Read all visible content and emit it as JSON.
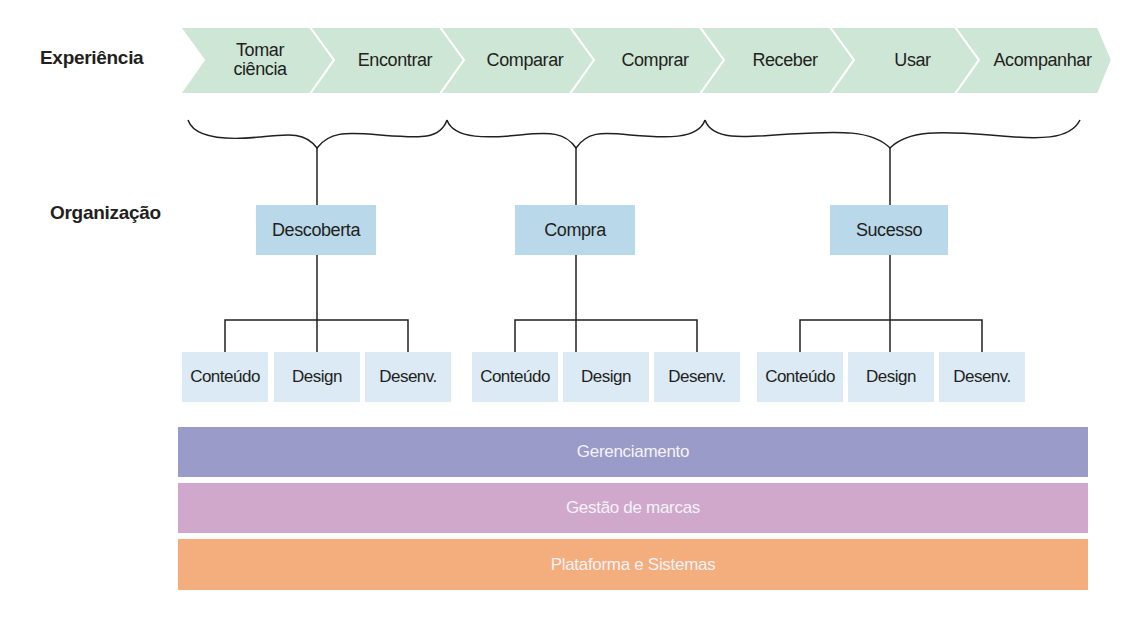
{
  "rows": {
    "experience_label": "Experiência",
    "organization_label": "Organização"
  },
  "experience_steps": [
    {
      "label": "Tomar\nciência"
    },
    {
      "label": "Encontrar"
    },
    {
      "label": "Comparar"
    },
    {
      "label": "Comprar"
    },
    {
      "label": "Receber"
    },
    {
      "label": "Usar"
    },
    {
      "label": "Acompanhar"
    }
  ],
  "groups": [
    {
      "label": "Descoberta",
      "children": [
        "Conteúdo",
        "Design",
        "Desenv."
      ]
    },
    {
      "label": "Compra",
      "children": [
        "Conteúdo",
        "Design",
        "Desenv."
      ]
    },
    {
      "label": "Sucesso",
      "children": [
        "Conteúdo",
        "Design",
        "Desenv."
      ]
    }
  ],
  "layers": [
    {
      "label": "Gerenciamento",
      "color": "#9a9bc8"
    },
    {
      "label": "Gestão de marcas",
      "color": "#cfa8cc"
    },
    {
      "label": "Plataforma e Sistemas",
      "color": "#f4ad7c"
    }
  ],
  "colors": {
    "chevron": "#cde6d5",
    "group_box": "#b9d8ea",
    "sub_box": "#dbeaf5",
    "line": "#231f20"
  }
}
